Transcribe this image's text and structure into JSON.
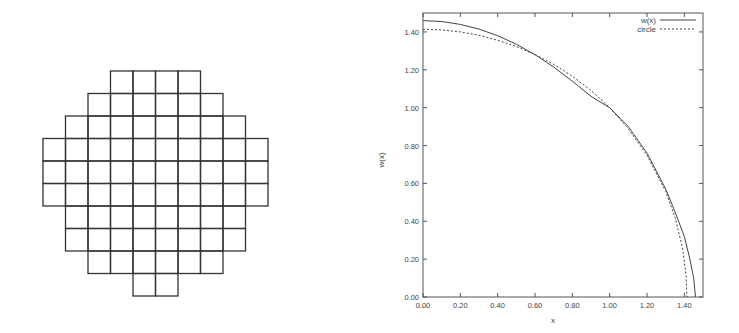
{
  "grid_figure": {
    "description": "Staircase approximation of a disc built from unit squares",
    "cell_size_px": 22.5,
    "origin_px": [
      43,
      71
    ],
    "line_color": "#333333",
    "rows": [
      {
        "start_col": 3,
        "end_col": 6
      },
      {
        "start_col": 2,
        "end_col": 7
      },
      {
        "start_col": 1,
        "end_col": 8
      },
      {
        "start_col": 0,
        "end_col": 9
      },
      {
        "start_col": 0,
        "end_col": 9
      },
      {
        "start_col": 0,
        "end_col": 9
      },
      {
        "start_col": 1,
        "end_col": 8
      },
      {
        "start_col": 1,
        "end_col": 8
      },
      {
        "start_col": 2,
        "end_col": 7
      },
      {
        "start_col": 4,
        "end_col": 5
      }
    ]
  },
  "chart_data": {
    "type": "line",
    "title": "",
    "xlabel": "x",
    "ylabel": "w(x)",
    "xlim": [
      0.0,
      1.5
    ],
    "ylim": [
      0.0,
      1.5
    ],
    "grid": false,
    "legend_position": "top-right",
    "x_ticks": [
      "0.00",
      "0.20",
      "0.40",
      "0.60",
      "0.80",
      "1.00",
      "1.20",
      "1.40"
    ],
    "y_ticks": [
      "0.00",
      "0.20",
      "0.40",
      "0.60",
      "0.80",
      "1.00",
      "1.20",
      "1.40"
    ],
    "series": [
      {
        "name": "w(x)",
        "style": "solid",
        "x": [
          0.0,
          0.1,
          0.2,
          0.3,
          0.4,
          0.5,
          0.6,
          0.7,
          0.8,
          0.9,
          1.0,
          1.1,
          1.2,
          1.3,
          1.35,
          1.4,
          1.43,
          1.45,
          1.46
        ],
        "y": [
          1.46,
          1.455,
          1.44,
          1.415,
          1.38,
          1.335,
          1.28,
          1.215,
          1.14,
          1.06,
          1.0,
          0.9,
          0.76,
          0.57,
          0.45,
          0.32,
          0.2,
          0.1,
          0.0
        ]
      },
      {
        "name": "circle",
        "style": "dashed",
        "x": [
          0.0,
          0.1,
          0.2,
          0.3,
          0.4,
          0.5,
          0.6,
          0.7,
          0.8,
          0.9,
          1.0,
          1.1,
          1.2,
          1.3,
          1.35,
          1.39,
          1.41,
          1.414
        ],
        "y": [
          1.414,
          1.411,
          1.4,
          1.382,
          1.356,
          1.323,
          1.281,
          1.229,
          1.166,
          1.091,
          1.0,
          0.889,
          0.748,
          0.557,
          0.421,
          0.26,
          0.106,
          0.0
        ]
      }
    ]
  },
  "plot": {
    "legend": [
      {
        "label": "w(x)",
        "style": "solid"
      },
      {
        "label": "circle",
        "style": "dashed"
      }
    ],
    "xlabel": "x",
    "ylabel": "w(x)",
    "frame_color": "#444444",
    "line_color": "#444444"
  }
}
